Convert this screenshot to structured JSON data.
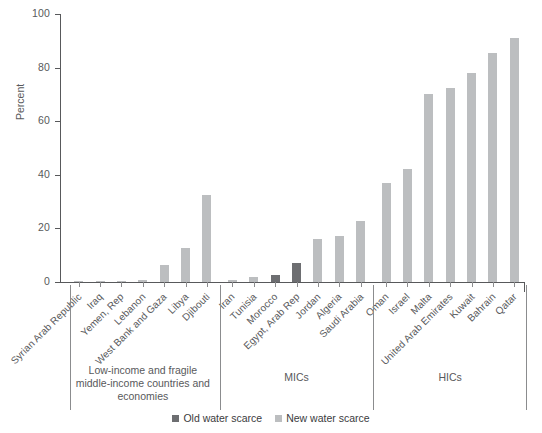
{
  "chart_data": {
    "type": "bar",
    "title": "",
    "xlabel": "",
    "ylabel": "Percent",
    "ylim": [
      0,
      100
    ],
    "yticks": [
      0,
      20,
      40,
      60,
      80,
      100
    ],
    "grid": false,
    "legend": {
      "position": "bottom-center",
      "entries": [
        {
          "label": "Old water scarce",
          "color": "#6d6e71"
        },
        {
          "label": "New water scarce",
          "color": "#bcbec0"
        }
      ]
    },
    "categories": [
      "Syrian Arab Republic",
      "Iraq",
      "Yemen, Rep",
      "Lebanon",
      "West Bank and Gaza",
      "Libya",
      "Djibouti",
      "Iran",
      "Tunisia",
      "Morocco",
      "Egypt, Arab Rep",
      "Jordan",
      "Algeria",
      "Saudi Arabia",
      "Oman",
      "Israel",
      "Malta",
      "United Arab Emirates",
      "Kuwait",
      "Bahrain",
      "Qatar"
    ],
    "values": [
      0.2,
      0.3,
      0.4,
      6.2,
      12.8,
      32.5,
      0.6,
      2.0,
      2.8,
      7.0,
      16.2,
      17.0,
      22.8,
      37.0,
      42.2,
      70.0,
      72.3,
      78.0,
      85.5,
      91.2,
      0
    ],
    "series_of_bar": [
      "new",
      "new",
      "new",
      "new",
      "new",
      "new",
      "new",
      "new",
      "old",
      "old",
      "new",
      "new",
      "new",
      "new",
      "new",
      "new",
      "new",
      "new",
      "new",
      "new",
      "new"
    ],
    "bars": [
      {
        "label": "Syrian Arab Republic",
        "value": 0.2,
        "series": "New water scarce",
        "group": "Low-income and fragile middle-income countries and economies"
      },
      {
        "label": "Iraq",
        "value": 0.3,
        "series": "New water scarce",
        "group": "Low-income and fragile middle-income countries and economies"
      },
      {
        "label": "Yemen, Rep",
        "value": 0.4,
        "series": "New water scarce",
        "group": "Low-income and fragile middle-income countries and economies"
      },
      {
        "label": "Lebanon",
        "value": 0.6,
        "series": "New water scarce",
        "group": "Low-income and fragile middle-income countries and economies"
      },
      {
        "label": "West Bank and Gaza",
        "value": 6.2,
        "series": "New water scarce",
        "group": "Low-income and fragile middle-income countries and economies"
      },
      {
        "label": "Libya",
        "value": 12.8,
        "series": "New water scarce",
        "group": "Low-income and fragile middle-income countries and economies"
      },
      {
        "label": "Djibouti",
        "value": 32.5,
        "series": "New water scarce",
        "group": "Low-income and fragile middle-income countries and economies"
      },
      {
        "label": "Iran",
        "value": 0.7,
        "series": "New water scarce",
        "group": "MICs"
      },
      {
        "label": "Tunisia",
        "value": 2.0,
        "series": "New water scarce",
        "group": "MICs"
      },
      {
        "label": "Morocco",
        "value": 2.8,
        "series": "Old water scarce",
        "group": "MICs"
      },
      {
        "label": "Egypt, Arab Rep",
        "value": 7.0,
        "series": "Old water scarce",
        "group": "MICs"
      },
      {
        "label": "Jordan",
        "value": 16.2,
        "series": "New water scarce",
        "group": "MICs"
      },
      {
        "label": "Algeria",
        "value": 17.0,
        "series": "New water scarce",
        "group": "MICs"
      },
      {
        "label": "Saudi Arabia",
        "value": 22.8,
        "series": "New water scarce",
        "group": "MICs"
      },
      {
        "label": "Oman",
        "value": 37.0,
        "series": "New water scarce",
        "group": "HICs"
      },
      {
        "label": "Israel",
        "value": 42.2,
        "series": "New water scarce",
        "group": "HICs"
      },
      {
        "label": "Malta",
        "value": 70.0,
        "series": "New water scarce",
        "group": "HICs"
      },
      {
        "label": "United Arab Emirates",
        "value": 72.3,
        "series": "New water scarce",
        "group": "HICs"
      },
      {
        "label": "Kuwait",
        "value": 78.0,
        "series": "New water scarce",
        "group": "HICs"
      },
      {
        "label": "Bahrain",
        "value": 85.5,
        "series": "New water scarce",
        "group": "HICs"
      },
      {
        "label": "Qatar",
        "value": 91.2,
        "series": "New water scarce",
        "group": "HICs"
      }
    ],
    "groups": [
      {
        "label": "Low-income and fragile middle-income countries and economies",
        "start": 0,
        "end": 6
      },
      {
        "label": "MICs",
        "start": 7,
        "end": 13
      },
      {
        "label": "HICs",
        "start": 14,
        "end": 20
      }
    ]
  },
  "colors": {
    "old_water_scarce": "#6d6e71",
    "new_water_scarce": "#bcbec0",
    "axis": "#58595b",
    "text": "#58595b",
    "background": "#ffffff"
  }
}
